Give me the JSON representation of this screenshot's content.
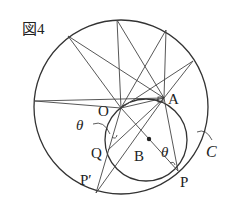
{
  "figure": {
    "title": "図4",
    "colors": {
      "line": "#333333",
      "background": "#ffffff"
    },
    "labels": {
      "O": "O",
      "A": "A",
      "B": "B",
      "P": "P",
      "Q": "Q",
      "P_prime": "P′",
      "C": "C",
      "theta_left": "θ",
      "theta_right": "θ"
    },
    "points": {
      "O": [
        121,
        108
      ],
      "A": [
        164,
        98
      ],
      "B": [
        149,
        139
      ],
      "P": [
        178,
        171
      ],
      "Q": [
        108,
        150
      ],
      "P_prime": [
        96,
        193
      ]
    },
    "big_circle": {
      "cx": 121,
      "cy": 107,
      "r": 87
    },
    "small_circle_C": {
      "cx": 146,
      "cy": 140,
      "r": 41
    }
  }
}
